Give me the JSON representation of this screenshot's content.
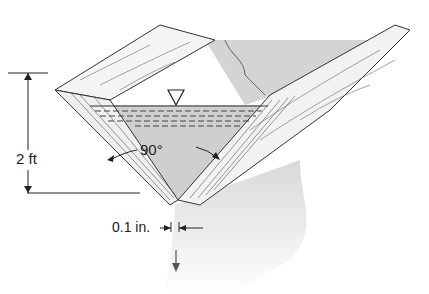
{
  "diagram": {
    "labels": {
      "height": "2 ft",
      "angle": "90°",
      "gap": "0.1 in."
    },
    "icons": {
      "water_surface": "inverted-triangle-icon",
      "flow": "down-arrow-icon"
    },
    "colors": {
      "water": "#d4d4d4",
      "stream": "#e2e2e2",
      "line": "#333333",
      "wood": "#f2f2f2"
    }
  }
}
